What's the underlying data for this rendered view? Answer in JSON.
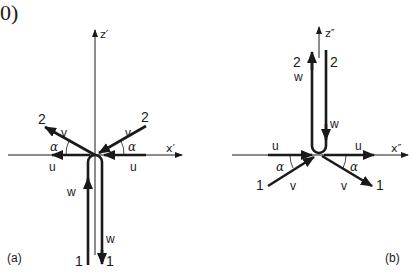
{
  "header": {
    "fragment": "0)"
  },
  "diagram_a": {
    "label": "(a)",
    "axes": {
      "x": "x′",
      "z": "z′"
    },
    "incoming_stream": {
      "id": "1",
      "velocity": "w"
    },
    "outgoing_stream": {
      "id": "1",
      "velocity": "w"
    },
    "left_branch": {
      "id": "2",
      "velocity": "v",
      "component": "u",
      "angle": "α"
    },
    "right_branch": {
      "id": "2",
      "velocity": "v",
      "component": "u",
      "angle": "α"
    }
  },
  "diagram_b": {
    "label": "(b)",
    "axes": {
      "x": "x″",
      "z": "z″"
    },
    "up_stream": {
      "id": "2",
      "velocity": "w"
    },
    "down_stream": {
      "id": "2",
      "velocity": "w"
    },
    "left_branch": {
      "id": "1",
      "velocity": "v",
      "component": "u",
      "angle": "α"
    },
    "right_branch": {
      "id": "1",
      "velocity": "v",
      "component": "u",
      "angle": "α"
    }
  },
  "colors": {
    "ink": "#1a1a1a",
    "background": "#ffffff"
  }
}
